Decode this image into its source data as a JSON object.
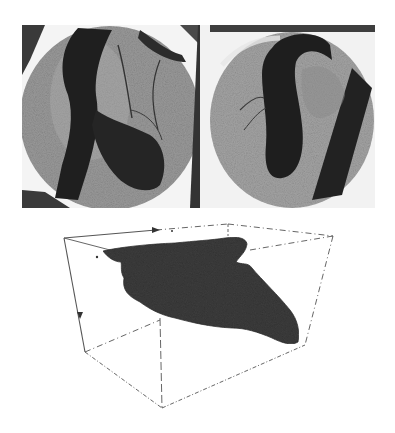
{
  "figure": {
    "background": "#ffffff",
    "panels": [
      {
        "id": "angiogram-left",
        "kind": "x-ray angiogram",
        "frame_color": "#3a3a3a",
        "disc_color": "#9a9a9a",
        "vessel_color": "#1e1e1e"
      },
      {
        "id": "angiogram-right",
        "kind": "x-ray angiogram",
        "frame_color": "#3a3a3a",
        "disc_color": "#a4a4a4",
        "vessel_color": "#1e1e1e"
      },
      {
        "id": "reconstruction-3d",
        "kind": "3d surface reconstruction in wireframe bounding box",
        "surface_color": "#3c3c3c",
        "box_line_color": "#555555"
      }
    ]
  }
}
